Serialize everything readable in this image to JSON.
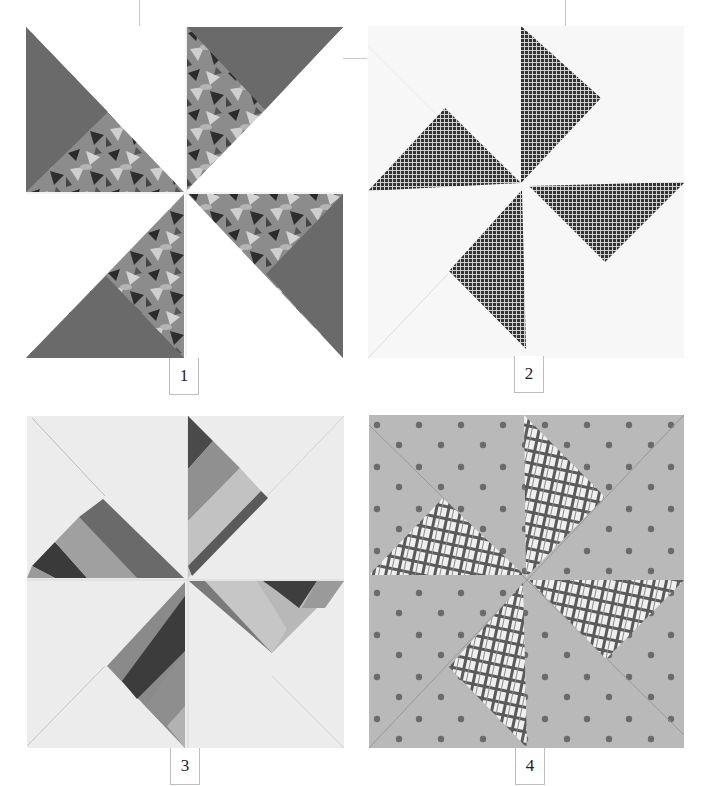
{
  "page": {
    "background": "#ffffff"
  },
  "blocks": [
    {
      "number": "1",
      "name": "Pinwheel with solid dark corners and floral blades",
      "colors": {
        "background": "#ffffff",
        "dark": "#6a6a6a",
        "print": "#8a8a8a",
        "print_dark": "#2a2a2a",
        "print_light": "#cfcfcf"
      }
    },
    {
      "number": "2",
      "name": "Pinwheel with checked blades on white",
      "colors": {
        "background": "#f7f7f7",
        "blade": "#3a3a3a",
        "grid": "#d8d8d8"
      }
    },
    {
      "number": "3",
      "name": "Pinwheel with strip-pieced blades",
      "colors": {
        "background": "#ececec",
        "stripes": [
          "#5a5a5a",
          "#9a9a9a",
          "#3e3e3e",
          "#b4b4b4",
          "#707070"
        ]
      }
    },
    {
      "number": "4",
      "name": "Pinwheel with plaid blades on dotted background",
      "colors": {
        "background": "#b8b8b8",
        "dot": "#6e6e6e",
        "plaid_bg": "#f0f0f0",
        "plaid_line": "#555555"
      }
    }
  ]
}
